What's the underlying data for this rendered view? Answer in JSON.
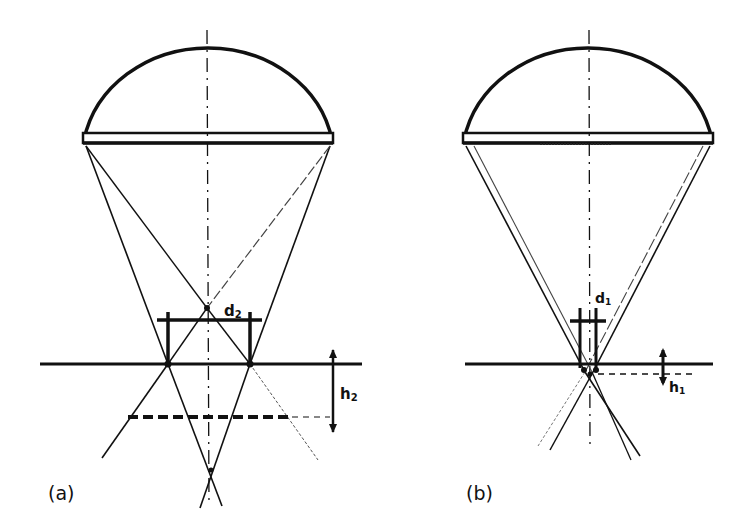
{
  "figure": {
    "panels": [
      {
        "id": "a",
        "label": "(a)",
        "dimension_width_label": "d",
        "dimension_width_subscript": "2",
        "dimension_height_label": "h",
        "dimension_height_subscript": "2"
      },
      {
        "id": "b",
        "label": "(b)",
        "dimension_width_label": "d",
        "dimension_width_subscript": "1",
        "dimension_height_label": "h",
        "dimension_height_subscript": "1"
      }
    ],
    "colors": {
      "ink": "#111111",
      "background": "#ffffff"
    }
  }
}
